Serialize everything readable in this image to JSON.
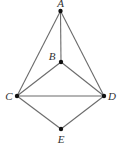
{
  "diagram": {
    "type": "graph",
    "points": [
      {
        "id": "A",
        "label": "A",
        "x": 60.5,
        "y": 11,
        "label_x": 60.5,
        "label_y": 7,
        "anchor": "middle"
      },
      {
        "id": "B",
        "label": "B",
        "x": 61,
        "y": 62,
        "label_x": 52,
        "label_y": 60,
        "anchor": "middle"
      },
      {
        "id": "C",
        "label": "C",
        "x": 17,
        "y": 96,
        "label_x": 9,
        "label_y": 100,
        "anchor": "middle"
      },
      {
        "id": "D",
        "label": "D",
        "x": 104,
        "y": 96,
        "label_x": 112,
        "label_y": 100,
        "anchor": "middle"
      },
      {
        "id": "E",
        "label": "E",
        "x": 61,
        "y": 129,
        "label_x": 61,
        "label_y": 143,
        "anchor": "middle"
      }
    ],
    "edges": [
      [
        "A",
        "B"
      ],
      [
        "A",
        "C"
      ],
      [
        "A",
        "D"
      ],
      [
        "B",
        "C"
      ],
      [
        "B",
        "D"
      ],
      [
        "C",
        "D"
      ],
      [
        "C",
        "E"
      ],
      [
        "D",
        "E"
      ]
    ],
    "colors": {
      "edge": "#6b6b6b",
      "vertex": "#111111",
      "label": "#333333"
    }
  }
}
